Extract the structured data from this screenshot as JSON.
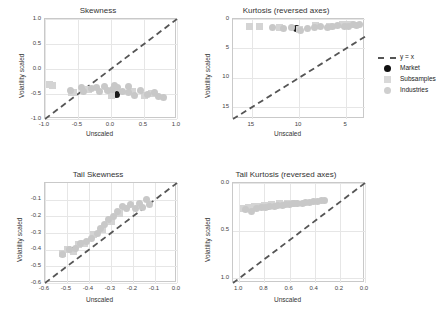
{
  "legend": {
    "items": [
      {
        "label": "y = x",
        "marker": "dashed-line"
      },
      {
        "label": "Market",
        "marker": "black-circle"
      },
      {
        "label": "Subsamples",
        "marker": "gray-square"
      },
      {
        "label": "Industries",
        "marker": "gray-circle"
      }
    ]
  },
  "chart_data": [
    {
      "type": "scatter",
      "title": "Skewness",
      "xlabel": "Unscaled",
      "ylabel": "Volatility scaled",
      "xlim": [
        -1.0,
        1.0
      ],
      "ylim": [
        -1.0,
        1.0
      ],
      "xticks": [
        -1.0,
        -0.5,
        0.0,
        0.5,
        1.0
      ],
      "yticks": [
        -1.0,
        -0.5,
        0.0,
        0.5,
        1.0
      ],
      "grid": true,
      "reference_line": "y = x",
      "series": [
        {
          "name": "Market",
          "points": [
            [
              0.08,
              -0.5
            ]
          ]
        },
        {
          "name": "Subsamples",
          "points": [
            [
              -0.93,
              -0.3
            ],
            [
              -0.88,
              -0.33
            ],
            [
              -0.6,
              -0.47
            ],
            [
              -0.57,
              -0.46
            ],
            [
              -0.34,
              -0.41
            ],
            [
              0.01,
              -0.52
            ],
            [
              0.33,
              -0.44
            ],
            [
              0.5,
              -0.52
            ],
            [
              0.62,
              -0.49
            ]
          ]
        },
        {
          "name": "Industries",
          "points": [
            [
              -0.62,
              -0.43
            ],
            [
              -0.45,
              -0.37
            ],
            [
              -0.41,
              -0.44
            ],
            [
              -0.3,
              -0.38
            ],
            [
              -0.22,
              -0.36
            ],
            [
              -0.18,
              -0.44
            ],
            [
              -0.1,
              -0.35
            ],
            [
              -0.05,
              -0.42
            ],
            [
              0.02,
              -0.4
            ],
            [
              0.1,
              -0.36
            ],
            [
              0.18,
              -0.45
            ],
            [
              0.26,
              -0.47
            ],
            [
              0.36,
              -0.52
            ],
            [
              0.44,
              -0.43
            ],
            [
              0.55,
              -0.5
            ],
            [
              0.66,
              -0.46
            ],
            [
              0.72,
              -0.55
            ],
            [
              0.8,
              -0.57
            ],
            [
              0.27,
              -0.35
            ],
            [
              0.06,
              -0.33
            ]
          ]
        }
      ]
    },
    {
      "type": "scatter",
      "title": "Kurtosis (reversed axes)",
      "xlabel": "Unscaled",
      "ylabel": "Volatility scaled",
      "xlim": [
        17.0,
        3.0
      ],
      "ylim": [
        17.0,
        0.0
      ],
      "xticks": [
        15,
        10,
        5
      ],
      "yticks": [
        0,
        5,
        10,
        15
      ],
      "grid": true,
      "reference_line": "y = x",
      "series": [
        {
          "name": "Market",
          "points": [
            [
              10.3,
              1.6
            ]
          ]
        },
        {
          "name": "Subsamples",
          "points": [
            [
              15.3,
              1.2
            ],
            [
              14.2,
              1.3
            ],
            [
              12.1,
              1.5
            ],
            [
              10.0,
              1.7
            ],
            [
              8.2,
              1.1
            ],
            [
              6.8,
              1.2
            ],
            [
              5.4,
              1.0
            ],
            [
              4.6,
              0.9
            ]
          ]
        },
        {
          "name": "Industries",
          "points": [
            [
              12.8,
              1.4
            ],
            [
              11.6,
              1.6
            ],
            [
              10.8,
              1.5
            ],
            [
              9.8,
              1.9
            ],
            [
              9.1,
              1.6
            ],
            [
              8.4,
              1.5
            ],
            [
              7.7,
              1.3
            ],
            [
              7.0,
              1.4
            ],
            [
              6.4,
              1.2
            ],
            [
              5.9,
              1.1
            ],
            [
              5.2,
              1.3
            ],
            [
              4.8,
              1.2
            ],
            [
              4.2,
              1.0
            ],
            [
              3.9,
              1.1
            ],
            [
              3.6,
              0.9
            ]
          ]
        }
      ]
    },
    {
      "type": "scatter",
      "title": "Tail Skewness",
      "xlabel": "Unscaled",
      "ylabel": "Volatility scaled",
      "xlim": [
        -0.6,
        0.0
      ],
      "ylim": [
        -0.6,
        0.0
      ],
      "xticks": [
        -0.6,
        -0.5,
        -0.4,
        -0.3,
        -0.2,
        -0.1,
        0.0
      ],
      "yticks": [
        -0.6,
        -0.5,
        -0.4,
        -0.3,
        -0.2,
        -0.1
      ],
      "grid": true,
      "reference_line": "y = x",
      "series": [
        {
          "name": "Market",
          "points": [
            [
              -0.475,
              -0.405
            ]
          ]
        },
        {
          "name": "Subsamples",
          "points": [
            [
              -0.52,
              -0.42
            ],
            [
              -0.5,
              -0.4
            ],
            [
              -0.47,
              -0.41
            ],
            [
              -0.45,
              -0.37
            ],
            [
              -0.42,
              -0.36
            ],
            [
              -0.38,
              -0.31
            ],
            [
              -0.34,
              -0.28
            ],
            [
              -0.3,
              -0.23
            ],
            [
              -0.26,
              -0.18
            ]
          ]
        },
        {
          "name": "Industries",
          "points": [
            [
              -0.52,
              -0.43
            ],
            [
              -0.49,
              -0.4
            ],
            [
              -0.46,
              -0.39
            ],
            [
              -0.44,
              -0.36
            ],
            [
              -0.41,
              -0.35
            ],
            [
              -0.39,
              -0.33
            ],
            [
              -0.36,
              -0.3
            ],
            [
              -0.35,
              -0.27
            ],
            [
              -0.33,
              -0.25
            ],
            [
              -0.31,
              -0.22
            ],
            [
              -0.29,
              -0.2
            ],
            [
              -0.27,
              -0.17
            ],
            [
              -0.25,
              -0.14
            ],
            [
              -0.23,
              -0.155
            ],
            [
              -0.21,
              -0.13
            ],
            [
              -0.19,
              -0.155
            ],
            [
              -0.17,
              -0.12
            ],
            [
              -0.155,
              -0.145
            ],
            [
              -0.14,
              -0.1
            ],
            [
              -0.125,
              -0.13
            ]
          ]
        }
      ]
    },
    {
      "type": "scatter",
      "title": "Tail Kurtosis (reversed axes)",
      "xlabel": "Unscaled",
      "ylabel": "Volatility scaled",
      "xlim": [
        1.05,
        0.0
      ],
      "ylim": [
        1.05,
        0.0
      ],
      "xticks": [
        1.0,
        0.8,
        0.6,
        0.4,
        0.2,
        0.0
      ],
      "yticks": [
        1.0,
        0.5,
        0.0
      ],
      "grid": true,
      "reference_line": "y = x",
      "series": [
        {
          "name": "Market",
          "points": [
            [
              0.78,
              0.245
            ]
          ]
        },
        {
          "name": "Subsamples",
          "points": [
            [
              0.97,
              0.27
            ],
            [
              0.93,
              0.26
            ],
            [
              0.88,
              0.25
            ],
            [
              0.84,
              0.245
            ],
            [
              0.8,
              0.235
            ],
            [
              0.74,
              0.23
            ],
            [
              0.68,
              0.22
            ],
            [
              0.62,
              0.215
            ],
            [
              0.56,
              0.21
            ]
          ]
        },
        {
          "name": "Industries",
          "points": [
            [
              0.95,
              0.28
            ],
            [
              0.9,
              0.3
            ],
            [
              0.86,
              0.265
            ],
            [
              0.82,
              0.26
            ],
            [
              0.79,
              0.255
            ],
            [
              0.76,
              0.25
            ],
            [
              0.72,
              0.245
            ],
            [
              0.7,
              0.24
            ],
            [
              0.66,
              0.235
            ],
            [
              0.63,
              0.23
            ],
            [
              0.6,
              0.225
            ],
            [
              0.57,
              0.22
            ],
            [
              0.54,
              0.215
            ],
            [
              0.5,
              0.21
            ],
            [
              0.47,
              0.205
            ],
            [
              0.44,
              0.2
            ],
            [
              0.41,
              0.195
            ],
            [
              0.38,
              0.19
            ],
            [
              0.35,
              0.185
            ],
            [
              0.32,
              0.18
            ]
          ]
        }
      ]
    }
  ],
  "colors": {
    "market": "#1a1a1a",
    "subsamples": "#d4d4d4",
    "industries": "#c8c8c8",
    "refline": "#555555",
    "grid": "#e6e6e6",
    "axis": "#c9c9c9"
  }
}
